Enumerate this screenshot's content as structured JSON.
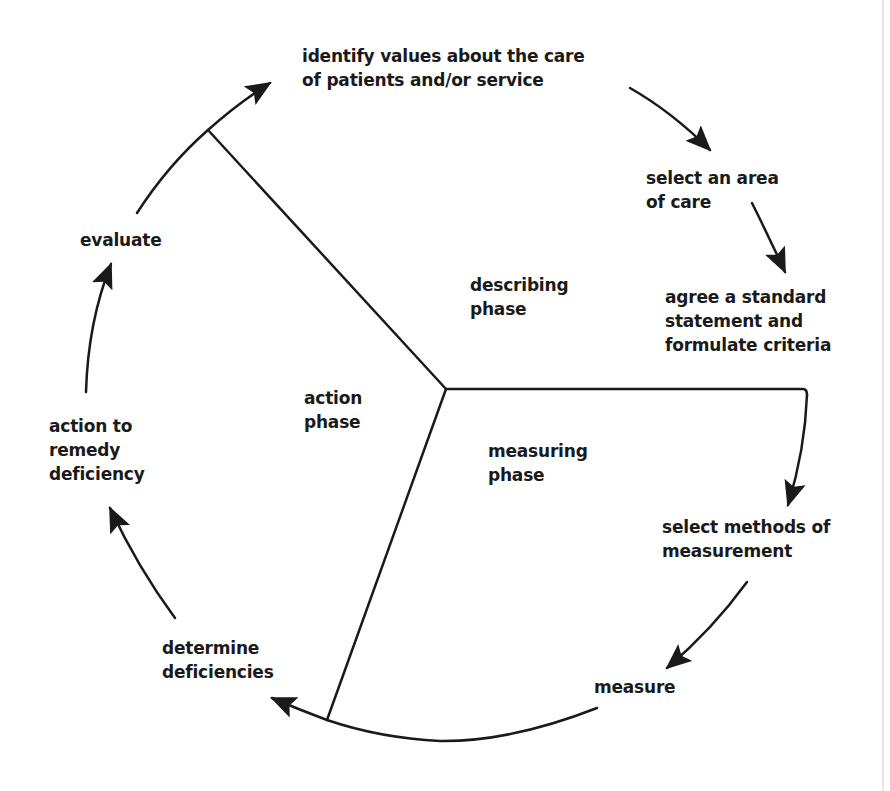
{
  "diagram": {
    "type": "cycle",
    "colors": {
      "stroke": "#1a1a1a",
      "background": "#ffffff",
      "edge": "#e6e6e6"
    },
    "center": [
      446,
      389
    ],
    "phases": [
      {
        "id": "describing",
        "label": "describing\nphase"
      },
      {
        "id": "measuring",
        "label": "measuring\nphase"
      },
      {
        "id": "action",
        "label": "action\nphase"
      }
    ],
    "steps": [
      {
        "id": "identify-values",
        "label": "identify values about the care\nof patients and/or service"
      },
      {
        "id": "select-area",
        "label": "select an area\nof care"
      },
      {
        "id": "agree-standard",
        "label": "agree a standard\nstatement and\nformulate criteria"
      },
      {
        "id": "select-methods",
        "label": "select methods of\nmeasurement"
      },
      {
        "id": "measure",
        "label": "measure"
      },
      {
        "id": "determine-deficiencies",
        "label": "determine\ndeficiencies"
      },
      {
        "id": "action-remedy",
        "label": "action to\nremedy\ndeficiency"
      },
      {
        "id": "evaluate",
        "label": "evaluate"
      }
    ]
  }
}
